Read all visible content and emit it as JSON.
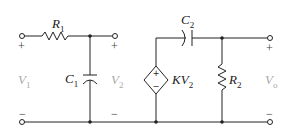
{
  "diagram": {
    "type": "circuit",
    "components": {
      "R1": {
        "label": "R",
        "sub": "1"
      },
      "C1": {
        "label": "C",
        "sub": "1"
      },
      "C2": {
        "label": "C",
        "sub": "2"
      },
      "R2": {
        "label": "R",
        "sub": "2"
      },
      "source": {
        "label": "KV",
        "sub": "2"
      }
    },
    "voltages": {
      "V1": {
        "label": "V",
        "sub": "1"
      },
      "V2": {
        "label": "V",
        "sub": "2"
      },
      "Vo": {
        "label": "V",
        "sub": "o"
      }
    },
    "signs": {
      "plus": "+",
      "minus": "−"
    },
    "colors": {
      "wire": "#222222",
      "voltage_label": "#aaaaaa"
    }
  }
}
